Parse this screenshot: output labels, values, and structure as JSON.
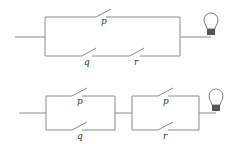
{
  "diagram": {
    "type": "switching-circuits",
    "circuits": [
      {
        "id": "circuit-1",
        "description": "p in parallel with (q in series with r), connected to a light bulb",
        "switches": {
          "top": "p",
          "bottom_left": "q",
          "bottom_right": "r"
        }
      },
      {
        "id": "circuit-2",
        "description": "(p parallel q) in series with (p parallel r), connected to a light bulb",
        "switches": {
          "block1_top": "p",
          "block1_bottom": "q",
          "block2_top": "p",
          "block2_bottom": "r"
        }
      }
    ],
    "colors": {
      "wire": "#8a8a8a",
      "bulb_base": "#555555"
    }
  }
}
